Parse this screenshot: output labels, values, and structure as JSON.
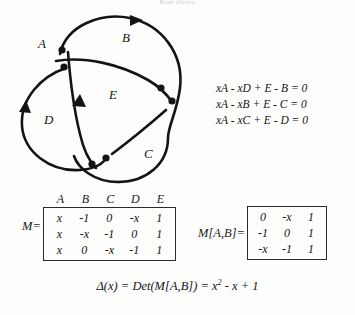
{
  "figure": {
    "top_caption": "Knot theory",
    "knot": {
      "labels": [
        {
          "id": "A",
          "text": "A",
          "x": 38,
          "y": 38
        },
        {
          "id": "B",
          "text": "B",
          "x": 122,
          "y": 32
        },
        {
          "id": "C",
          "text": "C",
          "x": 144,
          "y": 148
        },
        {
          "id": "D",
          "text": "D",
          "x": 44,
          "y": 114
        },
        {
          "id": "E",
          "text": "E",
          "x": 109,
          "y": 89
        }
      ],
      "crossing_dots": [
        {
          "x": 62,
          "y": 44
        },
        {
          "x": 64,
          "y": 61
        },
        {
          "x": 161,
          "y": 82
        },
        {
          "x": 172,
          "y": 95
        },
        {
          "x": 92,
          "y": 158
        },
        {
          "x": 106,
          "y": 152
        }
      ]
    },
    "equations": [
      "xA - xD + E - B = 0",
      "xA - xB + E - C = 0",
      "xA - xC + E - D = 0"
    ],
    "matrix_m": {
      "name": "M=",
      "column_headers": [
        "A",
        "B",
        "C",
        "D",
        "E"
      ],
      "rows": [
        [
          "x",
          "-1",
          "0",
          "-x",
          "1"
        ],
        [
          "x",
          "-x",
          "-1",
          "0",
          "1"
        ],
        [
          "x",
          "0",
          "-x",
          "-1",
          "1"
        ]
      ]
    },
    "matrix_ab": {
      "name": "M[A,B]=",
      "rows": [
        [
          "0",
          "-x",
          "1"
        ],
        [
          "-1",
          "0",
          "1"
        ],
        [
          "-x",
          "-1",
          "1"
        ]
      ]
    },
    "determinant": {
      "lhs": "Δ(x) = Det(M[A,B])  =  x",
      "exponent": "2",
      "rhs": " - x + 1"
    }
  },
  "colors": {
    "ink": "#141414",
    "paper": "#fdfdfc",
    "rule": "#2a2a2a"
  }
}
